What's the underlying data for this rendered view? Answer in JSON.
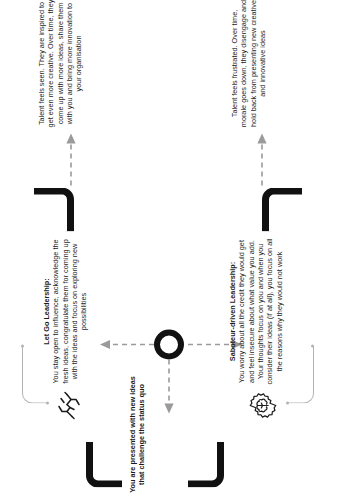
{
  "diagram": {
    "type": "flow-comparison",
    "orientation": "rotated-90-ccw",
    "trigger": {
      "text": "You are presented with new ideas that challenge the status quo"
    },
    "center": {
      "icon": "decision-ring-icon",
      "label": ""
    },
    "branches": [
      {
        "id": "let-go",
        "icon": "handshake-letting-go-icon",
        "title": "Let Go Leadership:",
        "body": "You stay open to influence, acknowledge the fresh ideas, congratulate them for coming up with the ideas and focus on exploring new possibilities",
        "outcome": "Talent feels seen. They are inspired to get even more creative. Over time, they come up with more ideas, share them with you and bring more innovation to your organisation"
      },
      {
        "id": "saboteur",
        "icon": "brain-gear-icon",
        "title": "Saboteur-driven Leadership:",
        "body": "You worry about all the credit they would get and feel insecure about what value you add. Your thoughts focus on you and when you consider their ideas (if at all), you focus on all the reasons why they would not work",
        "outcome": "Talent feels frustrated. Over time, morale goes down, they disengage and hold back from presenting new creative and innovative ideas"
      }
    ],
    "colors": {
      "ink": "#1b1b1b",
      "connector_black": "#111111",
      "connector_grey": "#b3b3b3",
      "arrow_grey": "#9a9a9a",
      "background": "#ffffff"
    }
  }
}
